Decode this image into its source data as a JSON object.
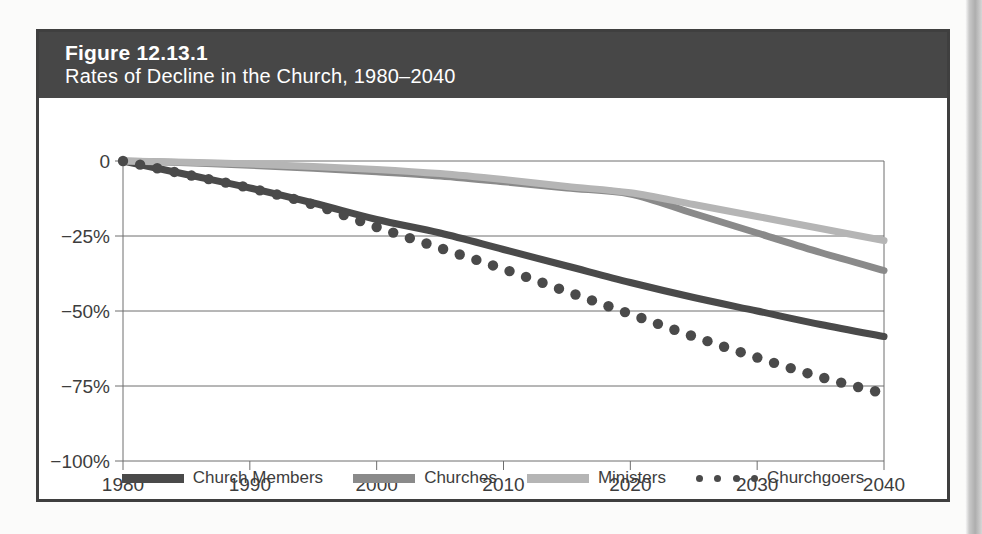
{
  "figure": {
    "number": "Figure 12.13.1",
    "subtitle": "Rates of Decline in the Church, 1980–2040"
  },
  "colors": {
    "header_bg": "#474747",
    "border": "#3f3f3f",
    "church_members": "#4a4a4a",
    "churches": "#8a8a8a",
    "ministers": "#b5b5b5",
    "churchgoers": "#4a4a4a",
    "gridline": "#6e6e6e",
    "axis": "#6e6e6e",
    "text": "#3d3d3d"
  },
  "legend": {
    "items": [
      {
        "label": "Church Members",
        "style": "solid",
        "color": "#4a4a4a"
      },
      {
        "label": "Churches",
        "style": "solid",
        "color": "#8a8a8a"
      },
      {
        "label": "Ministers",
        "style": "solid",
        "color": "#b5b5b5"
      },
      {
        "label": "Churchgoers",
        "style": "dotted",
        "color": "#4a4a4a"
      }
    ]
  },
  "chart_data": {
    "type": "line",
    "title": "Rates of Decline in the Church, 1980–2040",
    "xlabel": "",
    "ylabel": "",
    "xlim": [
      1980,
      2040
    ],
    "ylim": [
      -100,
      0
    ],
    "grid": true,
    "grid_axis": "y",
    "legend_position": "bottom",
    "xticks": [
      1980,
      1990,
      2000,
      2010,
      2020,
      2030,
      2040
    ],
    "xticklabels": [
      "1980",
      "1990",
      "2000",
      "2010",
      "2020",
      "2030",
      "2040"
    ],
    "yticks": [
      0,
      -25,
      -50,
      -75,
      -100
    ],
    "yticklabels": [
      "0",
      "−25%",
      "−50%",
      "−75%",
      "−100%"
    ],
    "x": [
      1980,
      1985,
      1990,
      1995,
      2000,
      2005,
      2010,
      2015,
      2020,
      2025,
      2030,
      2035,
      2040
    ],
    "series": [
      {
        "name": "Church Members",
        "style": "solid",
        "color": "#4a4a4a",
        "values": [
          0,
          -4.5,
          -9,
          -14,
          -19.5,
          -24,
          -29.5,
          -35,
          -40.5,
          -45.5,
          -50,
          -54.5,
          -58.5
        ]
      },
      {
        "name": "Churches",
        "style": "solid",
        "color": "#8a8a8a",
        "values": [
          0,
          -0.6,
          -1.4,
          -2.4,
          -3.6,
          -5.0,
          -6.9,
          -9.0,
          -11.0,
          -17.5,
          -24.0,
          -30.5,
          -36.5
        ]
      },
      {
        "name": "Ministers",
        "style": "solid",
        "color": "#b5b5b5",
        "values": [
          0,
          -0.4,
          -1.0,
          -1.8,
          -2.8,
          -4.2,
          -6.2,
          -8.5,
          -10.6,
          -14.5,
          -18.5,
          -22.5,
          -26.5
        ]
      },
      {
        "name": "Churchgoers",
        "style": "dotted",
        "color": "#4a4a4a",
        "values": [
          0,
          -4.5,
          -9,
          -14.5,
          -22,
          -29,
          -36,
          -43.5,
          -51,
          -58.5,
          -65.5,
          -72,
          -77.5
        ]
      }
    ]
  }
}
